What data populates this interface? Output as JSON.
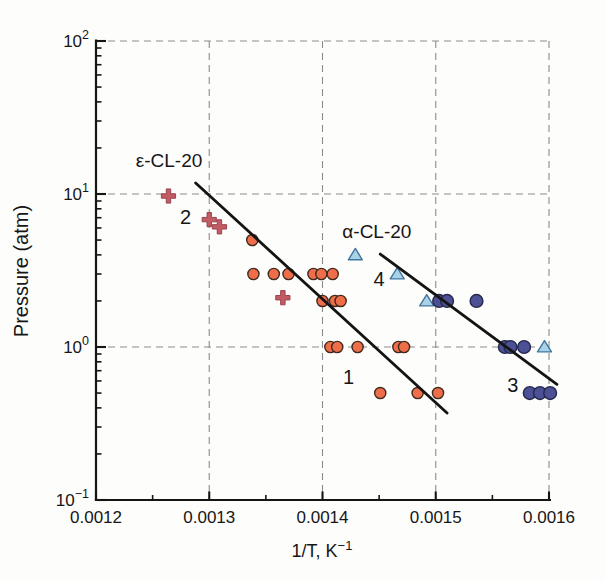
{
  "figure_background": "#fdfdfc",
  "text_color": "#161616",
  "chart_data": {
    "type": "scatter",
    "title": "",
    "xlabel": "1/T, K^-1",
    "xlabel_parts": {
      "main": "1/T, K",
      "sup": "−1"
    },
    "ylabel": "Pressure (atm)",
    "x_axis": {
      "min": 0.0012,
      "max": 0.0016,
      "scale": "linear",
      "major_ticks": [
        0.0012,
        0.0013,
        0.0014,
        0.0015,
        0.0016
      ],
      "tick_labels": [
        "0.0012",
        "0.0013",
        "0.0014",
        "0.0015",
        "0.0016"
      ],
      "minor_ticks": [
        0.00125,
        0.00135,
        0.00145,
        0.00155
      ]
    },
    "y_axis": {
      "min": 0.1,
      "max": 100,
      "scale": "log",
      "major_ticks": [
        100,
        10,
        1,
        0.1
      ],
      "tick_labels": [
        {
          "base": "10",
          "exp": "2"
        },
        {
          "base": "10",
          "exp": "1"
        },
        {
          "base": "10",
          "exp": "0"
        },
        {
          "base": "10",
          "exp": "−1"
        }
      ],
      "minor_ticks": [
        90,
        80,
        70,
        60,
        50,
        40,
        30,
        20,
        9,
        8,
        7,
        6,
        5,
        4,
        3,
        2,
        0.9,
        0.8,
        0.7,
        0.6,
        0.5,
        0.4,
        0.3,
        0.2
      ]
    },
    "grid": {
      "show": true,
      "style": "dashed",
      "color": "#8c8c8c"
    },
    "legend": {
      "show": false
    },
    "series": [
      {
        "name": "epsilon-cl20-crosses",
        "group": "ε-CL-20",
        "curve_label": "2",
        "marker": "plus",
        "color": "#c25b63",
        "stroke": "#9a434c",
        "marker_size": 7,
        "points": [
          [
            0.001264,
            9.7
          ],
          [
            0.0013,
            6.8
          ],
          [
            0.001309,
            6.1
          ],
          [
            0.001365,
            2.1
          ]
        ]
      },
      {
        "name": "epsilon-cl20-circles",
        "group": "ε-CL-20",
        "curve_label": "1",
        "marker": "circle",
        "color": "#ee6e4a",
        "stroke": "#40291d",
        "marker_size": 5.6,
        "points": [
          [
            0.001338,
            5.0
          ],
          [
            0.001339,
            3.0
          ],
          [
            0.001357,
            3.0
          ],
          [
            0.00137,
            3.0
          ],
          [
            0.001392,
            3.0
          ],
          [
            0.001399,
            3.0
          ],
          [
            0.001409,
            3.0
          ],
          [
            0.0014,
            2.0
          ],
          [
            0.001411,
            2.0
          ],
          [
            0.001416,
            2.0
          ],
          [
            0.001407,
            1.0
          ],
          [
            0.001413,
            1.0
          ],
          [
            0.001431,
            1.0
          ],
          [
            0.001467,
            1.0
          ],
          [
            0.001472,
            1.0
          ],
          [
            0.001451,
            0.5
          ],
          [
            0.001484,
            0.5
          ],
          [
            0.001502,
            0.5
          ]
        ]
      },
      {
        "name": "alpha-cl20-triangles",
        "group": "α-CL-20",
        "curve_label": "4",
        "marker": "triangle",
        "color": "#a9d2e8",
        "stroke": "#41759e",
        "marker_size": 7,
        "points": [
          [
            0.001429,
            4.0
          ],
          [
            0.001466,
            3.0
          ],
          [
            0.001492,
            2.0
          ],
          [
            0.001596,
            1.0
          ]
        ]
      },
      {
        "name": "alpha-cl20-circles",
        "group": "α-CL-20",
        "curve_label": "3",
        "marker": "circle",
        "color": "#4c5094",
        "stroke": "#25284c",
        "marker_size": 6.4,
        "points": [
          [
            0.001503,
            2.0
          ],
          [
            0.00151,
            2.0
          ],
          [
            0.001536,
            2.0
          ],
          [
            0.001561,
            1.0
          ],
          [
            0.001566,
            1.0
          ],
          [
            0.001578,
            1.0
          ],
          [
            0.001583,
            0.5
          ],
          [
            0.001592,
            0.5
          ],
          [
            0.001601,
            0.5
          ]
        ]
      }
    ],
    "fit_lines": [
      {
        "name": "fit-line-epsilon-1",
        "color": "#141414",
        "from": [
          0.001288,
          11.8
        ],
        "to": [
          0.00151,
          0.37
        ]
      },
      {
        "name": "fit-line-alpha-3",
        "color": "#141414",
        "from": [
          0.001451,
          4.05
        ],
        "to": [
          0.001607,
          0.57
        ]
      }
    ],
    "annotations": [
      {
        "text": "ε-CL-20",
        "x": 0.0012645,
        "y": 16.5,
        "font_size": 19
      },
      {
        "text": "2",
        "x": 0.001279,
        "y": 7.1,
        "font_size": 20
      },
      {
        "text": "α-CL-20",
        "x": 0.001448,
        "y": 5.7,
        "font_size": 19
      },
      {
        "text": "4",
        "x": 0.00145,
        "y": 2.78,
        "font_size": 20
      },
      {
        "text": "1",
        "x": 0.001423,
        "y": 0.64,
        "font_size": 20
      },
      {
        "text": "3",
        "x": 0.001568,
        "y": 0.565,
        "font_size": 20
      }
    ]
  }
}
